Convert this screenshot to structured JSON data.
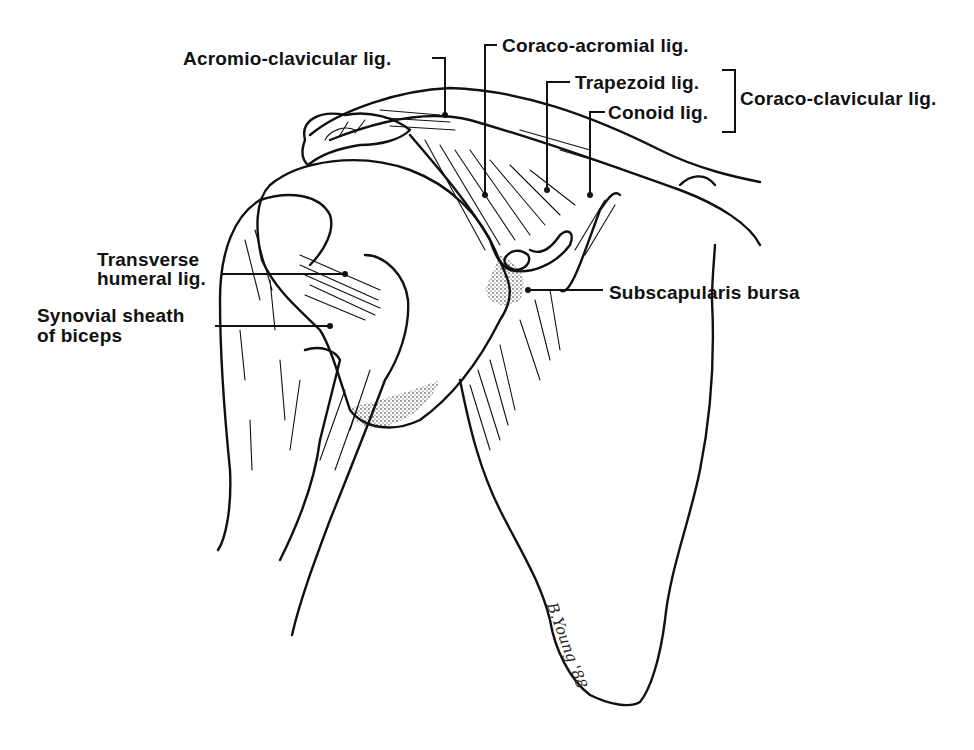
{
  "figure": {
    "colors": {
      "ink": "#111111",
      "background": "#ffffff",
      "stipple": "#222222"
    },
    "labels": {
      "acromio_clavicular": "Acromio-clavicular lig.",
      "coraco_acromial": "Coraco-acromial lig.",
      "trapezoid": "Trapezoid lig.",
      "conoid": "Conoid lig.",
      "coraco_clavicular": "Coraco-clavicular lig.",
      "transverse_humeral_line1": "Transverse",
      "transverse_humeral_line2": "humeral lig.",
      "synovial_sheath_line1": "Synovial sheath",
      "synovial_sheath_line2": "of biceps",
      "subscapularis_bursa": "Subscapularis bursa"
    },
    "signature": "B.Young '88"
  }
}
